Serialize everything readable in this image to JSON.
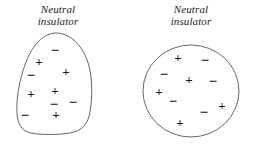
{
  "figure": {
    "title_left": "Neutral insulator",
    "title_right": "Neutral insulator",
    "background_color": "#ffffff",
    "outline_color": "#555555",
    "charge_color": "#1a1a1a"
  },
  "left_object": {
    "caption_line1": "Neutral",
    "caption_line2": "insulator",
    "shape": "irregular-blob",
    "charges": [
      {
        "sign": "−",
        "x": 55,
        "y": 50
      },
      {
        "sign": "+",
        "x": 39,
        "y": 61
      },
      {
        "sign": "−",
        "x": 31,
        "y": 75
      },
      {
        "sign": "+",
        "x": 66,
        "y": 71
      },
      {
        "sign": "+",
        "x": 31,
        "y": 93
      },
      {
        "sign": "+",
        "x": 55,
        "y": 90
      },
      {
        "sign": "−",
        "x": 54,
        "y": 104
      },
      {
        "sign": "−",
        "x": 73,
        "y": 102
      },
      {
        "sign": "−",
        "x": 25,
        "y": 115
      },
      {
        "sign": "+",
        "x": 56,
        "y": 114
      }
    ],
    "plus_count": 5,
    "minus_count": 5,
    "net_charge": 0
  },
  "right_object": {
    "caption_line1": "Neutral",
    "caption_line2": "insulator",
    "shape": "circle",
    "charges": [
      {
        "sign": "+",
        "x": 178,
        "y": 57
      },
      {
        "sign": "−",
        "x": 205,
        "y": 60
      },
      {
        "sign": "−",
        "x": 164,
        "y": 74
      },
      {
        "sign": "+",
        "x": 189,
        "y": 79
      },
      {
        "sign": "−",
        "x": 213,
        "y": 81
      },
      {
        "sign": "+",
        "x": 159,
        "y": 91
      },
      {
        "sign": "−",
        "x": 173,
        "y": 101
      },
      {
        "sign": "+",
        "x": 222,
        "y": 105
      },
      {
        "sign": "−",
        "x": 204,
        "y": 112
      },
      {
        "sign": "+",
        "x": 180,
        "y": 122
      }
    ],
    "plus_count": 5,
    "minus_count": 5,
    "net_charge": 0
  }
}
